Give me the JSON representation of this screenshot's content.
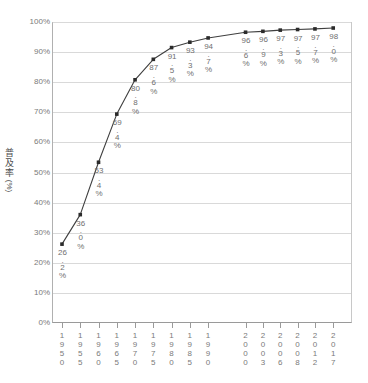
{
  "chart_data": {
    "type": "line",
    "title": "",
    "xlabel": "",
    "ylabel": "普及率（％）",
    "ylim": [
      0,
      100
    ],
    "grid": true,
    "legend": "none",
    "categories": [
      "1950",
      "1955",
      "1960",
      "1965",
      "1970",
      "1975",
      "1980",
      "1985",
      "1990",
      "2000",
      "2003",
      "2006",
      "2008",
      "2012",
      "2017"
    ],
    "values": [
      26.2,
      36.0,
      53.4,
      69.4,
      80.8,
      87.6,
      91.5,
      93.3,
      94.7,
      96.6,
      96.9,
      97.3,
      97.5,
      97.7,
      98.0
    ],
    "point_labels": [
      "26.2%",
      "36.0%",
      "53.4%",
      "69.4%",
      "80.8%",
      "87.6%",
      "91.5%",
      "93.3%",
      "94.7%",
      "96.6%",
      "96.9%",
      "97.3%",
      "97.5%",
      "97.7%",
      "98.0%"
    ],
    "y_ticks": [
      "0%",
      "10%",
      "20%",
      "30%",
      "40%",
      "50%",
      "60%",
      "70%",
      "80%",
      "90%",
      "100%"
    ],
    "series": [
      {
        "name": "普及率",
        "values": [
          26.2,
          36.0,
          53.4,
          69.4,
          80.8,
          87.6,
          91.5,
          93.3,
          94.7,
          96.6,
          96.9,
          97.3,
          97.5,
          97.7,
          98.0
        ]
      }
    ],
    "colors": {
      "line": "#3f3f3f",
      "marker": "#2b2b2b",
      "grid": "#d9d9d9",
      "axis": "#9a9a9a",
      "text": "#7a7a7a"
    }
  },
  "axis": {
    "y_title_chars": [
      "普",
      "及",
      "率"
    ],
    "y_title_unit": "(%)"
  }
}
